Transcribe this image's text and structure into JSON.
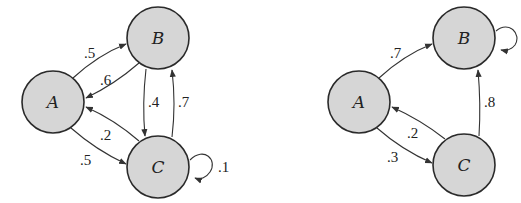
{
  "diagrams": [
    {
      "name": "left-markov-chain",
      "nodes": [
        {
          "id": "A",
          "label": "A",
          "cx": 53,
          "cy": 102
        },
        {
          "id": "B",
          "label": "B",
          "cx": 158,
          "cy": 38
        },
        {
          "id": "C",
          "label": "C",
          "cx": 158,
          "cy": 167
        }
      ],
      "edges": [
        {
          "from": "A",
          "to": "B",
          "label": ".5"
        },
        {
          "from": "B",
          "to": "A",
          "label": ".6"
        },
        {
          "from": "B",
          "to": "C",
          "label": ".4"
        },
        {
          "from": "C",
          "to": "B",
          "label": ".7"
        },
        {
          "from": "C",
          "to": "A",
          "label": ".2"
        },
        {
          "from": "A",
          "to": "C",
          "label": ".5"
        },
        {
          "from": "C",
          "to": "C",
          "label": ".1"
        }
      ]
    },
    {
      "name": "right-markov-chain",
      "nodes": [
        {
          "id": "A",
          "label": "A",
          "cx": 359,
          "cy": 102
        },
        {
          "id": "B",
          "label": "B",
          "cx": 464,
          "cy": 38
        },
        {
          "id": "C",
          "label": "C",
          "cx": 464,
          "cy": 165
        }
      ],
      "edges": [
        {
          "from": "A",
          "to": "B",
          "label": ".7"
        },
        {
          "from": "C",
          "to": "A",
          "label": ".2"
        },
        {
          "from": "A",
          "to": "C",
          "label": ".3"
        },
        {
          "from": "C",
          "to": "B",
          "label": ".8"
        },
        {
          "from": "B",
          "to": "B",
          "label": ""
        }
      ]
    }
  ],
  "colors": {
    "node_fill": "#d6d6d6",
    "node_stroke": "#2a2a2a",
    "edge": "#333333",
    "text": "#222222"
  }
}
